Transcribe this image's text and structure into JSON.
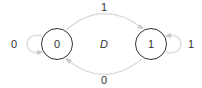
{
  "diagram": {
    "title": "D",
    "states": [
      {
        "id": "s0",
        "label": "0"
      },
      {
        "id": "s1",
        "label": "1"
      }
    ],
    "transitions": [
      {
        "from": "0",
        "to": "0",
        "label": "0"
      },
      {
        "from": "0",
        "to": "1",
        "label": "1"
      },
      {
        "from": "1",
        "to": "1",
        "label": "1"
      },
      {
        "from": "1",
        "to": "0",
        "label": "0"
      }
    ],
    "colors": {
      "state_stroke": "#333333",
      "edge": "#dcdcdc",
      "text": "#333333"
    }
  }
}
